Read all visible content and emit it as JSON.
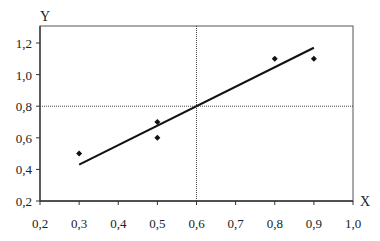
{
  "chart_data": {
    "type": "scatter",
    "title": "",
    "xlabel": "X",
    "ylabel": "Y",
    "xlim": [
      0.2,
      1.0
    ],
    "ylim": [
      0.2,
      1.3
    ],
    "x_ticks": [
      "0,2",
      "0,3",
      "0,4",
      "0,5",
      "0,6",
      "0,7",
      "0,8",
      "0,9",
      "1,0"
    ],
    "x_tick_values": [
      0.2,
      0.3,
      0.4,
      0.5,
      0.6,
      0.7,
      0.8,
      0.9,
      1.0
    ],
    "y_ticks": [
      "0,2",
      "0,4",
      "0,6",
      "0,8",
      "1,0",
      "1,2"
    ],
    "y_tick_values": [
      0.2,
      0.4,
      0.6,
      0.8,
      1.0,
      1.2
    ],
    "grid": false,
    "legend": null,
    "series": [
      {
        "name": "data",
        "marker": "diamond",
        "points": [
          {
            "x": 0.3,
            "y": 0.5
          },
          {
            "x": 0.5,
            "y": 0.7
          },
          {
            "x": 0.5,
            "y": 0.6
          },
          {
            "x": 0.8,
            "y": 1.1
          },
          {
            "x": 0.9,
            "y": 1.1
          }
        ]
      },
      {
        "name": "regression line",
        "type": "line",
        "points": [
          {
            "x": 0.3,
            "y": 0.43
          },
          {
            "x": 0.9,
            "y": 1.17
          }
        ]
      }
    ],
    "reference_lines": [
      {
        "orientation": "vertical",
        "x": 0.6,
        "style": "dotted"
      },
      {
        "orientation": "horizontal",
        "y": 0.8,
        "style": "dotted"
      }
    ]
  },
  "colors": {
    "axis": "#555555",
    "line": "#111111",
    "marker": "#111111",
    "reference": "#444444"
  }
}
